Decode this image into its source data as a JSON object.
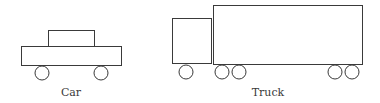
{
  "diagram": {
    "vehicles": [
      {
        "name": "car",
        "label": "Car",
        "label_pos": {
          "x": 71,
          "y": 96
        },
        "rects": [
          {
            "part": "cabin",
            "x": 48,
            "y": 30,
            "w": 46,
            "h": 16
          },
          {
            "part": "body",
            "x": 21,
            "y": 46,
            "w": 100,
            "h": 19
          }
        ],
        "wheels": [
          {
            "cx": 42,
            "cy": 73,
            "r": 7
          },
          {
            "cx": 101,
            "cy": 73,
            "r": 7
          }
        ]
      },
      {
        "name": "truck",
        "label": "Truck",
        "label_pos": {
          "x": 268,
          "y": 96
        },
        "rects": [
          {
            "part": "cab",
            "x": 172,
            "y": 18,
            "w": 39,
            "h": 45
          },
          {
            "part": "trailer",
            "x": 213,
            "y": 5,
            "w": 149,
            "h": 59
          }
        ],
        "wheels": [
          {
            "cx": 186,
            "cy": 72,
            "r": 7
          },
          {
            "cx": 222,
            "cy": 72,
            "r": 7
          },
          {
            "cx": 239,
            "cy": 72,
            "r": 7
          },
          {
            "cx": 335,
            "cy": 72,
            "r": 7
          },
          {
            "cx": 352,
            "cy": 72,
            "r": 7
          }
        ]
      }
    ],
    "stroke_color": "#3a3a3a",
    "background": "#ffffff"
  }
}
